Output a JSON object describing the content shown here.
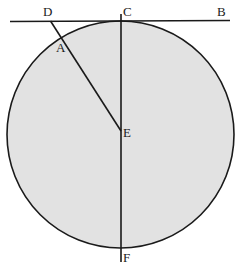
{
  "figure": {
    "background_color": "#ffffff",
    "circle_fill_color": "#e2e2e2",
    "stroke_color": "#1a1a1a",
    "label_color": "#1a1a1a",
    "width": 236,
    "height": 276
  },
  "circle": {
    "center_x": 120.5,
    "center_y": 134.5,
    "radius": 113.5,
    "stroke_width": 1.6
  },
  "lines": {
    "tangent": {
      "name": "tangent-line-DCB",
      "x1": 10,
      "y1": 21.5,
      "x2": 230,
      "y2": 20.5,
      "stroke_width": 1.6
    },
    "diameter": {
      "name": "diameter-line-CF",
      "x1": 121,
      "y1": 14,
      "x2": 121,
      "y2": 262,
      "stroke_width": 1.6
    },
    "secant": {
      "name": "segment-line-DAE",
      "x1": 50.5,
      "y1": 21,
      "x2": 121,
      "y2": 131,
      "stroke_width": 1.6
    }
  },
  "labels": [
    {
      "id": "D",
      "text": "D",
      "x": 43,
      "y": 5
    },
    {
      "id": "C",
      "text": "C",
      "x": 123,
      "y": 5
    },
    {
      "id": "B",
      "text": "B",
      "x": 217,
      "y": 5
    },
    {
      "id": "A",
      "text": "A",
      "x": 56,
      "y": 41
    },
    {
      "id": "E",
      "text": "E",
      "x": 123,
      "y": 126
    },
    {
      "id": "F",
      "text": "F",
      "x": 123,
      "y": 251
    }
  ]
}
